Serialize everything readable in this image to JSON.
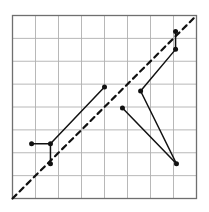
{
  "figure": {
    "title": "",
    "background_color": "#ffffff"
  },
  "chart_data": {
    "type": "line",
    "title": "",
    "xlabel": "",
    "ylabel": "",
    "xlim": [
      0,
      8
    ],
    "ylim": [
      0,
      8
    ],
    "grid": true,
    "grid_color": "#b0b0b0",
    "grid_columns": 8,
    "grid_rows": 8,
    "legend": "none",
    "tick_labels_x": [],
    "tick_labels_y": [],
    "annotations": [],
    "series": [
      {
        "name": "identity-reference-line",
        "style": "dashed",
        "color": "#111111",
        "linewidth": 2.2,
        "markers": false,
        "x": [
          0,
          8
        ],
        "y": [
          0,
          8
        ]
      },
      {
        "name": "path-lower-left",
        "style": "solid",
        "color": "#111111",
        "linewidth": 1.5,
        "markers": true,
        "x": [
          0.83,
          1.65,
          1.65
        ],
        "y": [
          2.39,
          2.39,
          1.52
        ]
      },
      {
        "name": "path-ascending-main",
        "style": "solid",
        "color": "#111111",
        "linewidth": 1.5,
        "markers": true,
        "x": [
          1.65,
          4.0
        ],
        "y": [
          2.39,
          4.87
        ]
      },
      {
        "name": "path-mid-to-upper-right",
        "style": "solid",
        "color": "#111111",
        "linewidth": 1.5,
        "markers": true,
        "x": [
          5.57,
          7.09,
          7.09
        ],
        "y": [
          4.7,
          6.52,
          7.3
        ]
      },
      {
        "name": "path-mid-to-bottom-right",
        "style": "solid",
        "color": "#111111",
        "linewidth": 1.5,
        "markers": true,
        "x": [
          5.57,
          7.13
        ],
        "y": [
          4.7,
          1.52
        ]
      },
      {
        "name": "path-inner-to-bottom-right",
        "style": "solid",
        "color": "#111111",
        "linewidth": 1.5,
        "markers": true,
        "x": [
          4.78,
          7.13
        ],
        "y": [
          3.96,
          1.52
        ]
      }
    ],
    "vertex_markers": [
      {
        "name": "vertex-left-outer",
        "x": 0.83,
        "y": 2.39
      },
      {
        "name": "vertex-left-inner",
        "x": 1.65,
        "y": 2.39
      },
      {
        "name": "vertex-left-bottom",
        "x": 1.65,
        "y": 1.52
      },
      {
        "name": "vertex-upper-mid",
        "x": 4.0,
        "y": 4.87
      },
      {
        "name": "vertex-inner-mid",
        "x": 4.78,
        "y": 3.96
      },
      {
        "name": "vertex-junction",
        "x": 5.57,
        "y": 4.7
      },
      {
        "name": "vertex-top-low",
        "x": 7.09,
        "y": 6.52
      },
      {
        "name": "vertex-top-high",
        "x": 7.09,
        "y": 7.3
      },
      {
        "name": "vertex-bottom-right",
        "x": 7.13,
        "y": 1.52
      }
    ]
  }
}
